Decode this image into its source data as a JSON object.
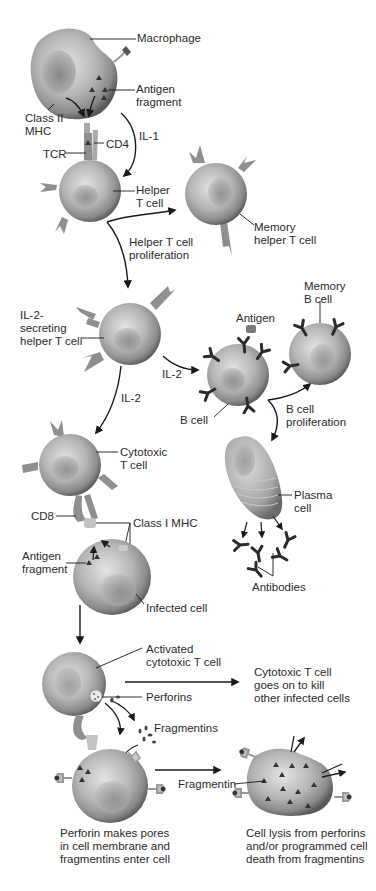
{
  "colors": {
    "background": "#ffffff",
    "text": "#2a2a2a",
    "cell_light": "#d9d9d9",
    "cell_mid": "#a8a8a8",
    "cell_dark": "#5e5e5e",
    "receptor": "#8f8f8f",
    "antibody": "#2b2b2b",
    "arrow": "#1a1a1a"
  },
  "labels": {
    "macrophage": "Macrophage",
    "antigen_fragment_top": "Antigen\nfragment",
    "class_ii_mhc": "Class II\nMHC",
    "il1": "IL-1",
    "cd4": "CD4",
    "tcr": "TCR",
    "helper_t_cell": "Helper\nT cell",
    "memory_helper_t_cell": "Memory\nhelper T cell",
    "helper_t_proliferation": "Helper T cell\nproliferation",
    "il2_secreting": "IL-2-\nsecreting\nhelper T cell",
    "memory_b_cell": "Memory\nB cell",
    "antigen": "Antigen",
    "il2_right": "IL-2",
    "il2_down": "IL-2",
    "b_cell": "B cell",
    "b_cell_proliferation": "B cell\nproliferation",
    "cytotoxic_t_cell": "Cytotoxic\nT cell",
    "plasma_cell": "Plasma\ncell",
    "cd8": "CD8",
    "class_i_mhc": "Class I MHC",
    "antigen_fragment_mid": "Antigen\nfragment",
    "antibodies": "Antibodies",
    "infected_cell": "Infected cell",
    "activated_cytotoxic": "Activated\ncytotoxic T cell",
    "goes_on_to_kill": "Cytotoxic T cell\ngoes on to kill\nother infected cells",
    "perforins": "Perforins",
    "fragmentins": "Fragmentins",
    "fragmentin": "Fragmentin",
    "caption_left": "Perforin makes pores\nin cell membrane and\nfragmentins enter cell",
    "caption_right": "Cell lysis from perforins\nand/or programmed cell\ndeath from fragmentins"
  }
}
